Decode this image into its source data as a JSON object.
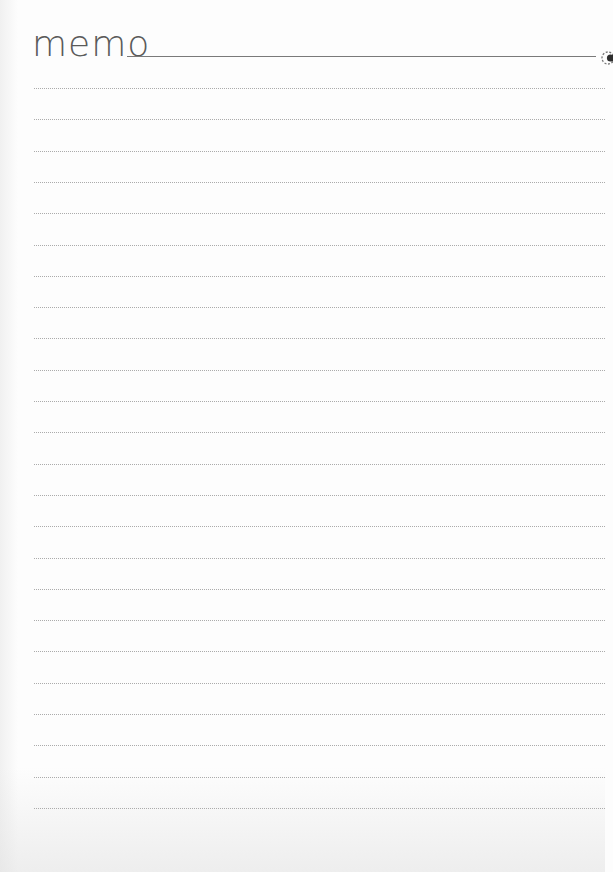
{
  "page": {
    "title": "memo",
    "ruled_line_count": 24,
    "first_line_y": 88,
    "line_spacing": 31.3,
    "colors": {
      "paper": "#fdfdfd",
      "title_text": "#5a5a5a",
      "rule": "#7a7a7a",
      "dotted_line": "#9d9d9d"
    }
  },
  "header": {
    "title": "memo",
    "ring_icon": "binder-ring-icon"
  },
  "lines": [
    {
      "label": ""
    },
    {
      "label": ""
    },
    {
      "label": ""
    },
    {
      "label": ""
    },
    {
      "label": ""
    },
    {
      "label": ""
    },
    {
      "label": ""
    },
    {
      "label": ""
    },
    {
      "label": ""
    },
    {
      "label": ""
    },
    {
      "label": ""
    },
    {
      "label": ""
    },
    {
      "label": ""
    },
    {
      "label": ""
    },
    {
      "label": ""
    },
    {
      "label": ""
    },
    {
      "label": ""
    },
    {
      "label": ""
    },
    {
      "label": ""
    },
    {
      "label": ""
    },
    {
      "label": ""
    },
    {
      "label": ""
    },
    {
      "label": ""
    },
    {
      "label": ""
    }
  ]
}
